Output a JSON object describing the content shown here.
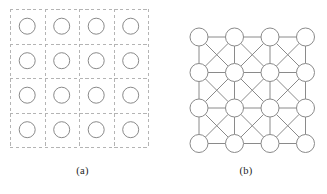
{
  "figure": {
    "panels": [
      {
        "id": "a",
        "caption": "(a)",
        "description": "grid-of-cells-with-nodes"
      },
      {
        "id": "b",
        "caption": "(b)",
        "description": "king-graph-lattice-with-diagonal-edges"
      }
    ]
  },
  "chart_data": {
    "type": "diagram",
    "title": "",
    "panel_a": {
      "type": "grid",
      "rows": 4,
      "cols": 4,
      "node_count": 16,
      "cell_size": 34.5,
      "origin": [
        10,
        9
      ],
      "node_radius": 8,
      "node_centers_x": [
        27.2,
        61.7,
        96.2,
        130.7
      ],
      "node_centers_y": [
        26.2,
        60.7,
        95.2,
        129.7
      ],
      "gridline_x": [
        10,
        44.5,
        79,
        113.5,
        148
      ],
      "gridline_y": [
        9,
        43.5,
        78,
        112.5,
        147
      ],
      "gridline_style": "dashed",
      "gridline_color": "#b4b4b4",
      "node_stroke": "#8a8a8a",
      "node_fill": "#ffffff"
    },
    "panel_b": {
      "type": "graph",
      "rows": 4,
      "cols": 4,
      "node_count": 16,
      "node_radius": 9,
      "node_centers_x": [
        34,
        69.5,
        105,
        140.5
      ],
      "node_centers_y": [
        37,
        72.5,
        108,
        143.5
      ],
      "connectivity": "8-neighbour king graph (horizontal, vertical and both diagonals of every cell)",
      "horizontal_edges": 12,
      "vertical_edges": 12,
      "diagonal_edges": 18,
      "edge_color": "#8a8a8a",
      "edge_width": 1,
      "node_stroke": "#8a8a8a",
      "node_fill": "#ffffff"
    },
    "colors": {
      "background": "#ffffff",
      "stroke": "#8a8a8a",
      "dashed": "#b4b4b4",
      "text": "#1b1b1b"
    }
  }
}
